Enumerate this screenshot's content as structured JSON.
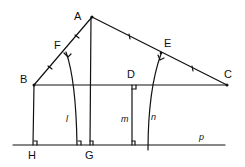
{
  "diagram": {
    "type": "geometry",
    "points": {
      "A": {
        "label": "A",
        "x": 92,
        "y": 17
      },
      "B": {
        "label": "B",
        "x": 34,
        "y": 85
      },
      "C": {
        "label": "C",
        "x": 227,
        "y": 85
      },
      "D": {
        "label": "D",
        "x": 133,
        "y": 85
      },
      "E": {
        "label": "E",
        "x": 161,
        "y": 53
      },
      "F": {
        "label": "F",
        "x": 65,
        "y": 50
      },
      "G": {
        "label": "G",
        "x": 90,
        "y": 145
      },
      "H": {
        "label": "H",
        "x": 33,
        "y": 145
      }
    },
    "lines": {
      "l": {
        "label": "l"
      },
      "m": {
        "label": "m"
      },
      "n": {
        "label": "n"
      },
      "p": {
        "label": "p"
      }
    },
    "stroke_color": "#111111",
    "background": "#ffffff"
  }
}
